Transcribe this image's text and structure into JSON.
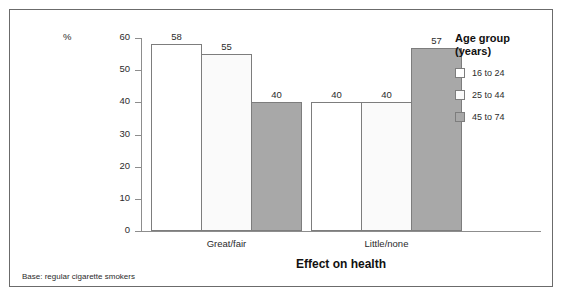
{
  "chart_data": {
    "type": "bar",
    "title": "",
    "subtitle": "",
    "xlabel": "Effect on health",
    "ylabel": "",
    "unit_label": "%",
    "categories": [
      "Great/fair",
      "Little/none"
    ],
    "series": [
      {
        "name": "16 to 24",
        "values": [
          58,
          40
        ],
        "color": "#ffffff"
      },
      {
        "name": "25 to 44",
        "values": [
          55,
          40
        ],
        "color": "#fafafa"
      },
      {
        "name": "45 to 74",
        "values": [
          40,
          57
        ],
        "color": "#a8a8a8"
      }
    ],
    "ylim": [
      0,
      60
    ],
    "yticks": [
      0,
      10,
      20,
      30,
      40,
      50,
      60
    ],
    "ytick_labels": [
      "0",
      "10",
      "20",
      "30",
      "40",
      "50",
      "60"
    ],
    "grid": false,
    "legend_position": "right",
    "bar_border_color": "#7d7d7d",
    "axis_color": "#8d8d8d",
    "data_labels": [
      [
        "58",
        "55",
        "40"
      ],
      [
        "40",
        "40",
        "57"
      ]
    ]
  },
  "legend": {
    "title": "Age group\n(years)",
    "items": [
      {
        "label": "16 to 24",
        "swatch": "#ffffff"
      },
      {
        "label": "25 to 44",
        "swatch": "#fafafa"
      },
      {
        "label": "45 to 74",
        "swatch": "#a8a8a8"
      }
    ]
  },
  "footer": {
    "base_note": "Base: regular cigarette smokers"
  }
}
